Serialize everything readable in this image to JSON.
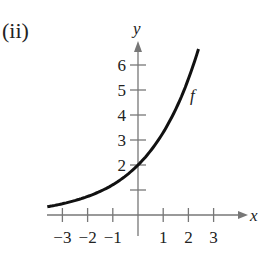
{
  "panel_label": "(ii)",
  "chart_data": {
    "type": "line",
    "title": "",
    "xlabel": "x",
    "ylabel": "y",
    "xlim": [
      -3.6,
      4
    ],
    "ylim": [
      -0.8,
      7
    ],
    "x_ticks": [
      -3,
      -2,
      -1,
      1,
      2,
      3
    ],
    "x_tick_labels": [
      "−3",
      "−2",
      "−1",
      "1",
      "2",
      "3"
    ],
    "y_ticks": [
      1,
      2,
      3,
      4,
      5,
      6
    ],
    "y_tick_labels": [
      "",
      "2",
      "3",
      "4",
      "5",
      "6"
    ],
    "grid": false,
    "series": [
      {
        "name": "f",
        "description": "increasing exponential curve passing through (0, 2)",
        "x": [
          -3.6,
          -3,
          -2,
          -1,
          0,
          1,
          2,
          2.4
        ],
        "y": [
          0.33,
          0.45,
          0.74,
          1.21,
          2.0,
          3.3,
          5.44,
          6.64
        ]
      }
    ],
    "annotations": [
      {
        "text": "f",
        "x": 2.2,
        "y": 4.9
      }
    ]
  }
}
